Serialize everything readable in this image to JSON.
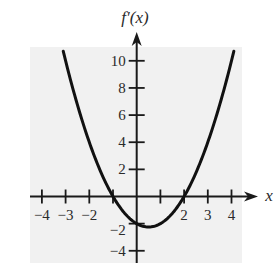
{
  "chart_data": {
    "type": "line",
    "title": "",
    "xlabel": "x",
    "ylabel": "f′(x)",
    "function": "x^2 - x - 2",
    "x_ticks": [
      -4,
      -3,
      -2,
      -1,
      1,
      2,
      3,
      4
    ],
    "x_tick_labels": [
      {
        "value": -4,
        "label": "−4"
      },
      {
        "value": -3,
        "label": "−3"
      },
      {
        "value": -2,
        "label": "−2"
      },
      {
        "value": 2,
        "label": "2"
      },
      {
        "value": 3,
        "label": "3"
      },
      {
        "value": 4,
        "label": "4"
      }
    ],
    "y_ticks": [
      -4,
      -2,
      2,
      4,
      6,
      8,
      10
    ],
    "y_tick_labels": [
      {
        "value": 10,
        "label": "10"
      },
      {
        "value": 8,
        "label": "8"
      },
      {
        "value": 6,
        "label": "6"
      },
      {
        "value": 4,
        "label": "4"
      },
      {
        "value": 2,
        "label": "2"
      },
      {
        "value": -2,
        "label": "−2"
      },
      {
        "value": -4,
        "label": "−4"
      }
    ],
    "xlim": [
      -4.5,
      5
    ],
    "ylim": [
      -5,
      12
    ],
    "grid": false,
    "series": [
      {
        "name": "f′(x)",
        "x": [
          -3.1,
          -3,
          -2.5,
          -2,
          -1.5,
          -1,
          -0.5,
          0,
          0.5,
          1,
          1.5,
          2,
          2.5,
          3,
          3.5,
          4,
          4.1
        ],
        "y": [
          10.71,
          10,
          6.75,
          4,
          1.75,
          0,
          -1.25,
          -2,
          -2.25,
          -2,
          -1.25,
          0,
          1.75,
          4,
          6.75,
          10,
          10.71
        ]
      }
    ],
    "annotations": {
      "roots": [
        -1,
        2
      ],
      "minimum": {
        "x": 0.5,
        "y": -2.25
      }
    },
    "colors": {
      "background": "#f1f1f1",
      "curve": "#111111",
      "axes": "#1a1a1a"
    }
  }
}
